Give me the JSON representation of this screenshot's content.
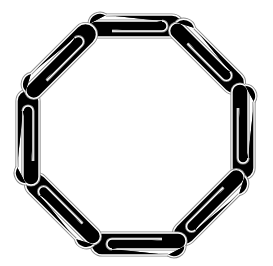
{
  "image": {
    "subject": "Eight paperclips linked together forming an octagonal ring",
    "background_color": "#ffffff",
    "stroke_color": "#8a8a8a",
    "inner_color": "#ffffff",
    "clip_count": 8
  }
}
